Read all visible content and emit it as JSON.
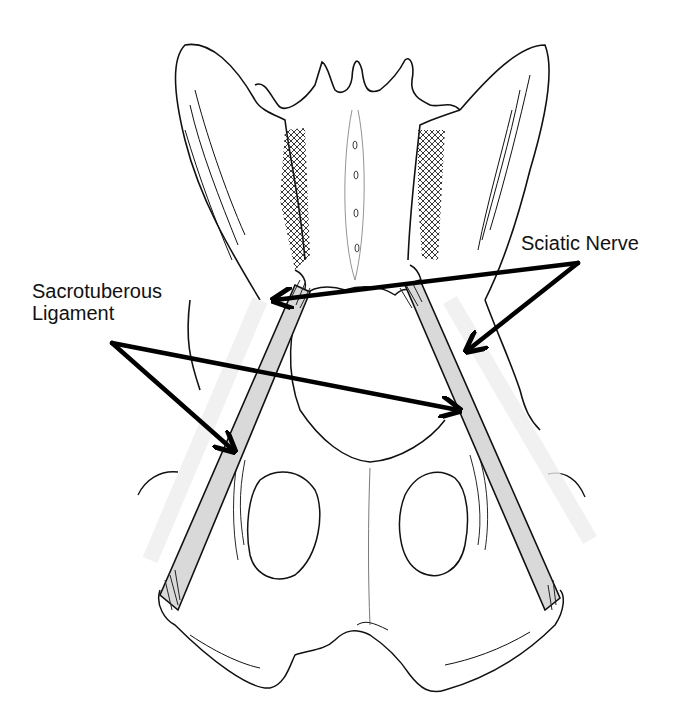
{
  "figure": {
    "colors": {
      "background": "#ffffff",
      "line": "#111111",
      "arrow": "#000000",
      "ligament_fill": "#d9d9d9",
      "hatch": "#222222"
    },
    "labels": {
      "sciatic_nerve": {
        "text": "Sciatic Nerve",
        "anchor": [
          578,
          263
        ],
        "targets": [
          [
            272,
            300
          ],
          [
            465,
            352
          ]
        ]
      },
      "sacrotuberous_ligament": {
        "lines": [
          "Sacrotuberous",
          "Ligament"
        ],
        "anchor": [
          112,
          343
        ],
        "targets": [
          [
            235,
            453
          ],
          [
            460,
            410
          ]
        ]
      }
    },
    "structures": [
      "sacrum",
      "ilium-left",
      "ilium-right",
      "obturator-foramen-left",
      "obturator-foramen-right",
      "ischium",
      "sacrotuberous-ligament-left",
      "sacrotuberous-ligament-right",
      "sciatic-nerve-left",
      "sciatic-nerve-right"
    ]
  }
}
